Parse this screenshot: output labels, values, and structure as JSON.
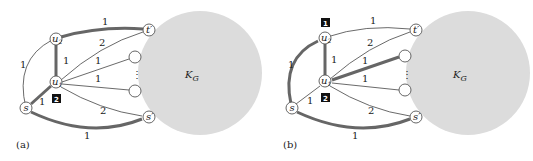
{
  "panels": [
    {
      "id": "a",
      "caption": "(a)",
      "cloud_label": "K",
      "cloud_sub": "G",
      "nodes": {
        "u2": "u",
        "u2_sub": "2",
        "u1": "u",
        "u1_sub": "1",
        "s": "s",
        "t": "t′",
        "sp": "s′",
        "dots": "⋮"
      },
      "edge_labels": {
        "s_u2": "1",
        "u2_t": "1",
        "u2_u1": "1",
        "u1_t": "2",
        "u1_c1": "1",
        "u1_c2": "1",
        "u1_sp": "2",
        "s_u1": "1",
        "s_sp": "1"
      },
      "thick_edges": [
        "u2_t",
        "u2_u1",
        "s_u1",
        "s_sp"
      ],
      "badges": [
        {
          "text": "2",
          "near": "u1"
        }
      ]
    },
    {
      "id": "b",
      "caption": "(b)",
      "cloud_label": "K",
      "cloud_sub": "G",
      "nodes": {
        "u2": "u",
        "u2_sub": "2",
        "u1": "u",
        "u1_sub": "1",
        "s": "s",
        "t": "t′",
        "sp": "s′",
        "dots": "⋮"
      },
      "edge_labels": {
        "s_u2": "1",
        "u2_t": "1",
        "u2_u1": "1",
        "u1_t": "2",
        "u1_c1": "1",
        "u1_c2": "1",
        "u1_sp": "2",
        "s_u1": "1",
        "s_sp": "1"
      },
      "thick_edges": [
        "s_u2",
        "u2_u1",
        "u1_c1",
        "s_sp"
      ],
      "badges": [
        {
          "text": "1",
          "near": "u2"
        },
        {
          "text": "2",
          "near": "u1"
        }
      ]
    }
  ]
}
